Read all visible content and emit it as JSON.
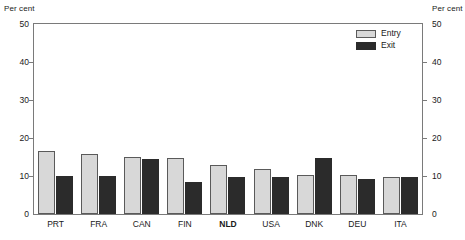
{
  "chart_data": {
    "type": "bar",
    "title": "",
    "subtitle": "",
    "xlabel": "",
    "ylabel": "Per cent",
    "ylabel_right": "Per cent",
    "ylim": [
      0,
      50
    ],
    "yticks": [
      0,
      10,
      20,
      30,
      40,
      50
    ],
    "grid": false,
    "legend_position": "top-right-inside",
    "categories": [
      "PRT",
      "FRA",
      "CAN",
      "FIN",
      "NLD",
      "USA",
      "DNK",
      "DEU",
      "ITA"
    ],
    "highlighted_category": "NLD",
    "series": [
      {
        "name": "Entry",
        "color": "#d8d8d8",
        "values": [
          16.5,
          15.9,
          15.1,
          14.7,
          13.0,
          11.8,
          10.3,
          10.2,
          9.7
        ]
      },
      {
        "name": "Exit",
        "color": "#2b2b2b",
        "values": [
          10.1,
          10.1,
          14.5,
          8.5,
          9.8,
          9.7,
          14.8,
          9.3,
          9.7
        ]
      }
    ]
  },
  "axes": {
    "left_unit": "Per cent",
    "right_unit": "Per cent",
    "tick_labels": [
      "50",
      "40",
      "30",
      "20",
      "10",
      "0"
    ]
  },
  "legend": {
    "entries": [
      {
        "label": "Entry"
      },
      {
        "label": "Exit"
      }
    ]
  },
  "colors": {
    "entry": "#d8d8d8",
    "exit": "#2b2b2b",
    "frame": "#7a7a7a",
    "text": "#1a1a1a",
    "background": "#ffffff"
  }
}
